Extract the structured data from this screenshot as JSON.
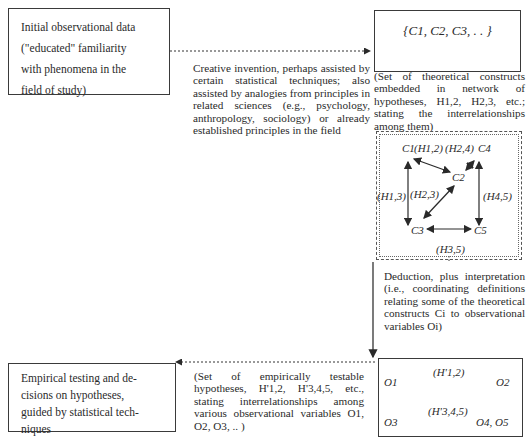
{
  "nodes": {
    "initial_data": {
      "lines": [
        "Initial observational data",
        "(\"educated\" familiarity",
        "with phenomena in the",
        "field of study)"
      ]
    },
    "constructs_set": {
      "label": "{C1, C2, C3, . . }"
    },
    "constructs_caption": {
      "text": "(Set of theoretical constructs embedded in network of hypotheses, H1,2, H2,3, etc.; stating the interrelationships among them)"
    },
    "empirical_testing": {
      "lines": [
        "Empirical testing and de-",
        "cisions on hypotheses,",
        "guided by statistical tech-",
        "niques"
      ]
    }
  },
  "edges": {
    "creative_invention": {
      "text": "Creative invention, perhaps assisted by certain statistical techniques; also assisted by analogies from principles in related sciences (e.g., psychology, anthropology, sociology) or already established principles in the field"
    },
    "deduction": {
      "text": "Deduction, plus interpretation (i.e., coordinating definitions relating some of the theoretical constructs Ci to observational variables Oi)"
    },
    "testable_hypotheses": {
      "text": "(Set of empirically testable hypotheses, H'1,2, H'3,4,5, etc., stating interrelationships among various observational variables O1, O2, O3, .. )"
    }
  },
  "network": {
    "nodes": [
      "C1",
      "C2",
      "C3",
      "C4",
      "C5"
    ],
    "hypotheses": [
      "(H1,2)",
      "(H2,4)",
      "(H1,3)",
      "(H2,3)",
      "(H4,5)",
      "(H3,5)"
    ]
  },
  "observational": {
    "row1": {
      "left": "O1",
      "label": "(H'1,2)",
      "right": "O2"
    },
    "row2": {
      "left": "O3",
      "label": "(H'3,4,5)",
      "right": "O4, O5"
    }
  }
}
